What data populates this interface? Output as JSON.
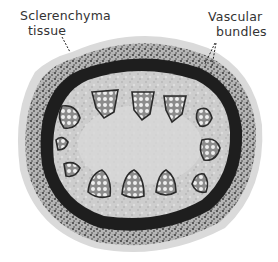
{
  "figure": {
    "type": "micrograph",
    "labels": [
      {
        "id": "sclerenchyma",
        "line1": "Sclerenchyma",
        "line2": "tissue"
      },
      {
        "id": "vascular",
        "line1": "Vascular",
        "line2": "bundles"
      }
    ],
    "colors": {
      "background": "#ffffff",
      "outer_rim": "#d9d9d9",
      "cortex_speckled": "#8a8a8a",
      "sclerenchyma_band": "#1f1f1f",
      "ground_tissue": "#c9c9c9",
      "bundle_fill": "#e6e6e6",
      "bundle_outline": "#2a2a2a",
      "label_text": "#333333"
    }
  }
}
